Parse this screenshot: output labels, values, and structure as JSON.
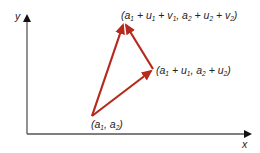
{
  "diagram": {
    "type": "vector-addition",
    "axes": {
      "x_label": "x",
      "y_label": "y",
      "color": "#555555"
    },
    "vector_color": "#b52a1c",
    "points": {
      "start": {
        "label_parts": [
          "(a",
          "1",
          ", a",
          "2",
          ")"
        ],
        "px": [
          92,
          116
        ]
      },
      "mid": {
        "label_parts": [
          "(a",
          "1",
          " + u",
          "1",
          ", a",
          "2",
          " + u",
          "2",
          ")"
        ],
        "px": [
          153,
          69
        ]
      },
      "end": {
        "label_parts": [
          "(a",
          "1",
          " + u",
          "1",
          " + v",
          "1",
          ", a",
          "2",
          " + u",
          "2",
          " + v",
          "2",
          ")"
        ],
        "px": [
          124,
          22
        ]
      }
    },
    "vectors": [
      {
        "name": "u",
        "from": "start",
        "to": "mid"
      },
      {
        "name": "v",
        "from": "mid",
        "to": "end"
      },
      {
        "name": "u+v",
        "from": "start",
        "to": "end"
      }
    ]
  }
}
